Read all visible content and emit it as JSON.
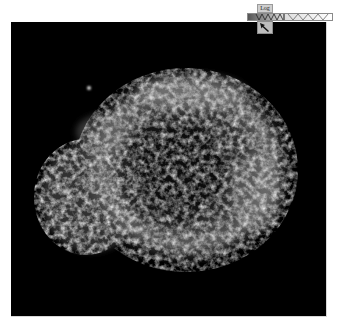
{
  "viewer": {
    "subject": "x-ray supernova remnant image",
    "background": "#000000"
  },
  "toolbar": {
    "scale_label": "Log",
    "colorbar": {
      "colors": [
        "#555555",
        "#ffffff"
      ],
      "pattern": "zigzag"
    },
    "pointer_tool": {
      "icon": "pointer-arrow-icon"
    }
  }
}
